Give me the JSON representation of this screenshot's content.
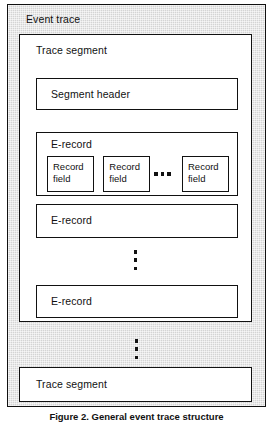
{
  "figure": {
    "caption": "Figure 2. General event trace structure",
    "colors": {
      "line": "#111111",
      "outer_fill": "#d4d4d4",
      "inner_fill": "#ffffff"
    }
  },
  "event_trace": {
    "label": "Event trace",
    "trace_segments": [
      {
        "label": "Trace segment",
        "segment_header": {
          "label": "Segment header"
        },
        "e_records": [
          {
            "label": "E-record",
            "record_fields": [
              {
                "line1": "Record",
                "line2": "field"
              },
              {
                "line1": "Record",
                "line2": "field"
              },
              {
                "line1": "Record",
                "line2": "field"
              }
            ],
            "fields_ellipsis": "horizontal"
          },
          {
            "label": "E-record"
          },
          {
            "label": "E-record"
          }
        ],
        "records_ellipsis": "vertical"
      },
      {
        "label": "Trace segment"
      }
    ],
    "segments_ellipsis": "vertical"
  }
}
